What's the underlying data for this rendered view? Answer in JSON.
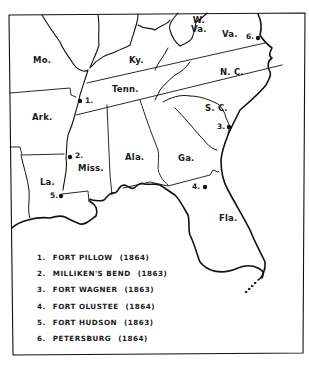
{
  "map": {
    "states": [
      {
        "id": "mo",
        "label": "Mo.",
        "x": 33,
        "y": 55
      },
      {
        "id": "ky",
        "label": "Ky.",
        "x": 129,
        "y": 55
      },
      {
        "id": "wva",
        "label": "W.\nVa.",
        "x": 192,
        "y": 17
      },
      {
        "id": "va",
        "label": "Va.",
        "x": 222,
        "y": 30
      },
      {
        "id": "tenn",
        "label": "Tenn.",
        "x": 112,
        "y": 87
      },
      {
        "id": "nc",
        "label": "N. C.",
        "x": 220,
        "y": 68
      },
      {
        "id": "ark",
        "label": "Ark.",
        "x": 32,
        "y": 113
      },
      {
        "id": "sc",
        "label": "S. C.",
        "x": 205,
        "y": 104
      },
      {
        "id": "miss",
        "label": "Miss.",
        "x": 78,
        "y": 164
      },
      {
        "id": "ala",
        "label": "Ala.",
        "x": 125,
        "y": 153
      },
      {
        "id": "ga",
        "label": "Ga.",
        "x": 178,
        "y": 154
      },
      {
        "id": "la",
        "label": "La.",
        "x": 40,
        "y": 178
      },
      {
        "id": "fla",
        "label": "Fla.",
        "x": 219,
        "y": 214
      }
    ],
    "sites": [
      {
        "num": "1.",
        "x": 80,
        "y": 101,
        "label_x": 85,
        "label_y": 97
      },
      {
        "num": "2.",
        "x": 70,
        "y": 157,
        "label_x": 75,
        "label_y": 151
      },
      {
        "num": "3.",
        "x": 229,
        "y": 127,
        "label_x": 217,
        "label_y": 122
      },
      {
        "num": "4.",
        "x": 205,
        "y": 187,
        "label_x": 192,
        "label_y": 183
      },
      {
        "num": "5.",
        "x": 61,
        "y": 196,
        "label_x": 50,
        "label_y": 192
      },
      {
        "num": "6.",
        "x": 258,
        "y": 38,
        "label_x": 246,
        "label_y": 33
      }
    ]
  },
  "legend": {
    "items": [
      {
        "num": "1.",
        "name": "FORT PILLOW",
        "year": "(1864)"
      },
      {
        "num": "2.",
        "name": "MILLIKEN'S BEND",
        "year": "(1863)"
      },
      {
        "num": "3.",
        "name": "FORT WAGNER",
        "year": "(1863)"
      },
      {
        "num": "4.",
        "name": "FORT OLUSTEE",
        "year": "(1864)"
      },
      {
        "num": "5.",
        "name": "FORT HUDSON",
        "year": "(1863)"
      },
      {
        "num": "6.",
        "name": "PETERSBURG",
        "year": "(1864)"
      }
    ]
  }
}
